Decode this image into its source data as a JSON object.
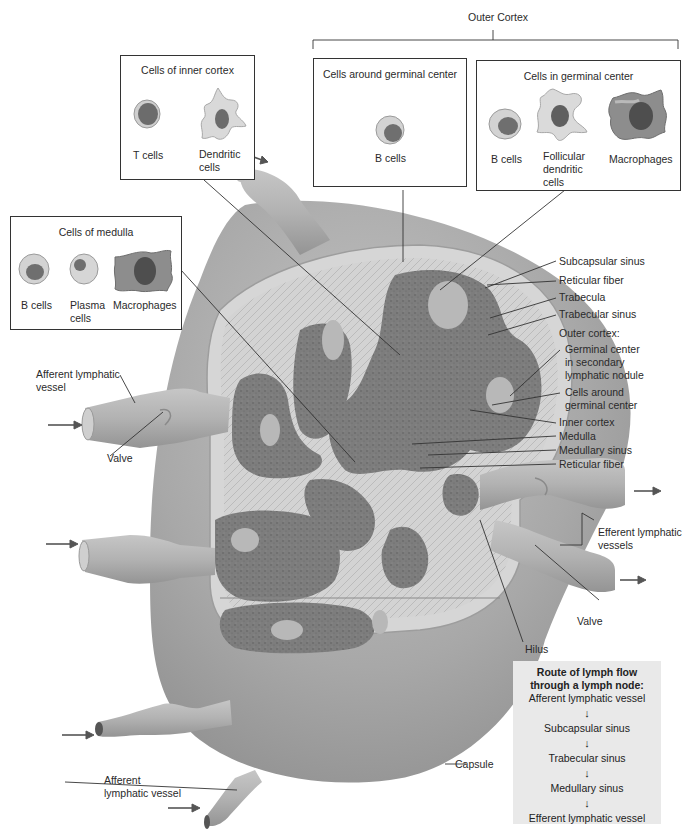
{
  "diagram": {
    "outer_cortex_bracket_label": "Outer Cortex",
    "boxes": {
      "inner_cortex": {
        "title": "Cells of inner cortex",
        "cells": [
          {
            "label": "T cells",
            "icon": "t-cell-icon"
          },
          {
            "label": "Dendritic\ncells",
            "icon": "dendritic-cell-icon"
          }
        ]
      },
      "around_germinal": {
        "title": "Cells around germinal center",
        "cells": [
          {
            "label": "B cells",
            "icon": "b-cell-icon"
          }
        ]
      },
      "in_germinal": {
        "title": "Cells in germinal center",
        "cells": [
          {
            "label": "B cells",
            "icon": "b-cell-icon"
          },
          {
            "label": "Follicular\ndendritic\ncells",
            "icon": "follicular-dendritic-cell-icon"
          },
          {
            "label": "Macrophages",
            "icon": "macrophage-icon"
          }
        ]
      },
      "medulla": {
        "title": "Cells of medulla",
        "cells": [
          {
            "label": "B cells",
            "icon": "b-cell-icon"
          },
          {
            "label": "Plasma\ncells",
            "icon": "plasma-cell-icon"
          },
          {
            "label": "Macrophages",
            "icon": "macrophage-icon"
          }
        ]
      }
    },
    "right_labels": [
      "Subcapsular sinus",
      "Reticular fiber",
      "Trabecula",
      "Trabecular sinus",
      "Outer cortex:",
      "Germinal center",
      "in secondary",
      "lymphatic nodule",
      "Cells around",
      "germinal center",
      "Inner cortex",
      "Medulla",
      "Medullary sinus",
      "Reticular fiber"
    ],
    "left_labels": {
      "afferent_top": [
        "Afferent lymphatic",
        "vessel"
      ],
      "valve_left": "Valve",
      "afferent_bottom": [
        "Afferent",
        "lymphatic vessel"
      ]
    },
    "lower_right_labels": {
      "efferent": [
        "Efferent lymphatic",
        "vessels"
      ],
      "valve_right": "Valve",
      "hilus": "Hilus",
      "capsule": "Capsule"
    },
    "route": {
      "title_line1": "Route of lymph flow",
      "title_line2": "through a lymph node:",
      "steps": [
        "Afferent lymphatic vessel",
        "Subcapsular sinus",
        "Trabecular sinus",
        "Medullary sinus",
        "Efferent lymphatic vessel"
      ],
      "arrow": "↓"
    },
    "colors": {
      "capsule": "#a9a9a9",
      "capsule_highlight": "#c9c9c9",
      "cortex_dark": "#7a7a7a",
      "germinal_center": "#b9b9b9",
      "sinus_light": "#d4d4d4",
      "route_bg": "#e9e9e9",
      "line": "#333333"
    }
  }
}
